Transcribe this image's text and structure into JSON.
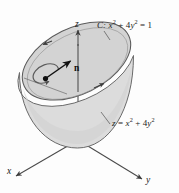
{
  "figure": {
    "axes": {
      "x_label": "x",
      "y_label": "y",
      "z_label": "z"
    },
    "labels": {
      "curve_prefix": "C:",
      "curve_equation_lhs": "x",
      "curve_equation": "C: x² + 4y² = 1",
      "surface_equation": "z = x² + 4y²",
      "normal_vector": "n"
    },
    "equation_parts": {
      "curve": {
        "name": "C:",
        "term1_base": "x",
        "term1_exp": "2",
        "plus": "+",
        "term2_coef": "4",
        "term2_base": "y",
        "term2_exp": "2",
        "equals": "=",
        "rhs": "1"
      },
      "surface": {
        "lhs": "z",
        "equals": "=",
        "term1_base": "x",
        "term1_exp": "2",
        "plus": "+",
        "term2_coef": "4",
        "term2_base": "y",
        "term2_exp": "2"
      }
    },
    "colors": {
      "surface_fill": "#d8d8d8",
      "cap_fill": "#d0d0d0",
      "outline": "#5a5a5a",
      "axis": "#4a4a4a",
      "ink": "#1a1a1a",
      "background": "#fdfdfd"
    }
  }
}
